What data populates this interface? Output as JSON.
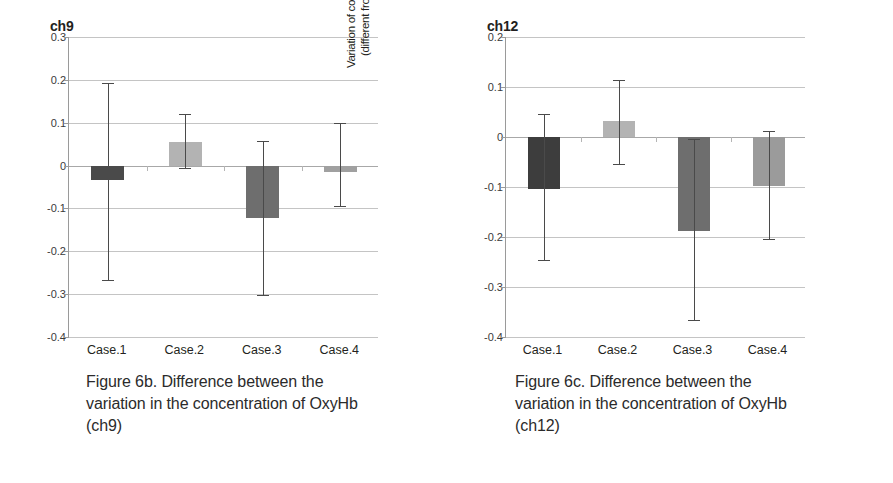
{
  "figure": {
    "panels": [
      {
        "id": "ch9",
        "title": "ch9",
        "caption_lines": [
          "Figure 6b. Difference between the",
          "variation in the concentration of OxyHb",
          "(ch9)"
        ],
        "caption_full": "Figure 6b. Difference between the variation in the concentration of OxyHb (ch9)"
      },
      {
        "id": "ch12",
        "title": "ch12",
        "caption_lines": [
          "Figure 6c. Difference between the",
          "variation in the concentration of OxyHb",
          "(ch12)"
        ],
        "caption_full": "Figure 6c. Difference between the variation in the concentration of OxyHb (ch12)"
      }
    ],
    "axis_title_lines": [
      "Variation of concentration of OxyHb",
      "(different from rest)(mM・mm)"
    ]
  },
  "chart_data": [
    {
      "type": "bar",
      "title": "ch9",
      "xlabel": "",
      "ylabel": "Variation of concentration of OxyHb (different from rest)(mM・mm)",
      "categories": [
        "Case.1",
        "Case.2",
        "Case.3",
        "Case.4"
      ],
      "values": [
        -0.033,
        0.056,
        -0.122,
        -0.015
      ],
      "error_upper": [
        0.193,
        0.12,
        0.058,
        0.1
      ],
      "error_lower": [
        -0.268,
        -0.005,
        -0.301,
        -0.095
      ],
      "ylim": [
        -0.4,
        0.3
      ],
      "yticks": [
        0.3,
        0.2,
        0.1,
        0,
        -0.1,
        -0.2,
        -0.3,
        -0.4
      ],
      "ytick_labels": [
        "0.3",
        "0.2",
        "0.1",
        "0",
        "-0.1",
        "-0.2",
        "-0.3",
        "-0.4"
      ],
      "bar_colors": [
        "#4a4a4a",
        "#b3b3b3",
        "#6e6e6e",
        "#a0a0a0"
      ],
      "errorbar_color": "#4a4a4a",
      "grid": true,
      "legend": "none"
    },
    {
      "type": "bar",
      "title": "ch12",
      "xlabel": "",
      "ylabel": "Variation of concentration of OxyHb (different from rest)(mM・mm)",
      "categories": [
        "Case.1",
        "Case.2",
        "Case.3",
        "Case.4"
      ],
      "values": [
        -0.104,
        0.032,
        -0.188,
        -0.097
      ],
      "error_upper": [
        0.046,
        0.115,
        -0.004,
        0.012
      ],
      "error_lower": [
        -0.245,
        -0.054,
        -0.366,
        -0.203
      ],
      "ylim": [
        -0.4,
        0.2
      ],
      "yticks": [
        0.2,
        0.1,
        0,
        -0.1,
        -0.2,
        -0.3,
        -0.4
      ],
      "ytick_labels": [
        "0.2",
        "0.1",
        "0",
        "-0.1",
        "-0.2",
        "-0.3",
        "-0.4"
      ],
      "bar_colors": [
        "#3d3d3d",
        "#b3b3b3",
        "#6e6e6e",
        "#9b9b9b"
      ],
      "errorbar_color": "#4a4a4a",
      "grid": true,
      "legend": "none"
    }
  ]
}
